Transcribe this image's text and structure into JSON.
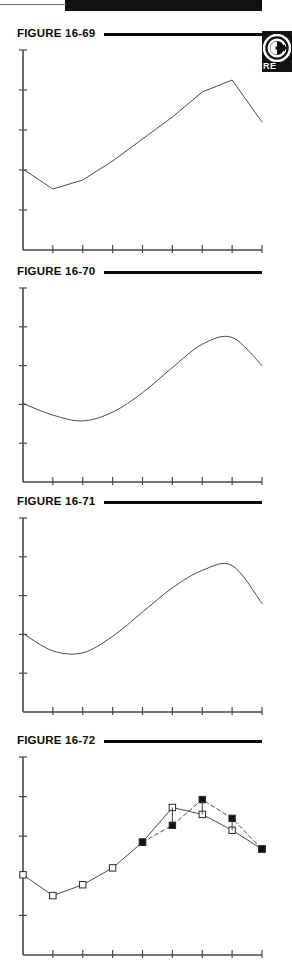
{
  "page": {
    "background_color": "#ffffff",
    "ink_color": "#0b0b0b",
    "line_color": "#555555",
    "width": 292,
    "height": 960
  },
  "top_bar": {
    "name": "page-edge-black-bar",
    "color": "#111111"
  },
  "badge": {
    "label": "RE",
    "icon": "circle-arrow-icon",
    "background": "#111111",
    "foreground": "#ffffff"
  },
  "figures": [
    {
      "label": "FIGURE 16-69",
      "top": 26,
      "plot_height": 224
    },
    {
      "label": "FIGURE 16-70",
      "top": 264,
      "plot_height": 218
    },
    {
      "label": "FIGURE 16-71",
      "top": 494,
      "plot_height": 218
    },
    {
      "label": "FIGURE 16-72",
      "top": 733,
      "plot_height": 222
    }
  ],
  "chart_data": [
    {
      "type": "line",
      "title": "FIGURE 16-69",
      "xlabel": "",
      "ylabel": "",
      "grid": false,
      "legend": "none",
      "axes": {
        "x_range": [
          0,
          8
        ],
        "y_range": [
          0,
          10
        ],
        "x_ticks": [
          1,
          2,
          3,
          4,
          5,
          6,
          7
        ],
        "y_ticks": [
          2,
          4,
          6,
          8
        ]
      },
      "series": [
        {
          "name": "series-1",
          "style": "solid",
          "marker": "none",
          "x": [
            0,
            1,
            2,
            3,
            4,
            5,
            6,
            7,
            8
          ],
          "y": [
            4.05,
            3.05,
            3.5,
            4.45,
            5.55,
            6.65,
            7.9,
            8.5,
            6.4
          ]
        }
      ]
    },
    {
      "type": "line",
      "title": "FIGURE 16-70",
      "xlabel": "",
      "ylabel": "",
      "grid": false,
      "legend": "none",
      "axes": {
        "x_range": [
          0,
          8
        ],
        "y_range": [
          0,
          10
        ],
        "x_ticks": [
          1,
          2,
          3,
          4,
          5,
          6,
          7
        ],
        "y_ticks": [
          2,
          4,
          6,
          8
        ]
      },
      "series": [
        {
          "name": "series-1",
          "style": "smooth",
          "marker": "none",
          "x": [
            0,
            1,
            2,
            3,
            4,
            5,
            6,
            7,
            8
          ],
          "y": [
            4.05,
            3.45,
            3.15,
            3.6,
            4.6,
            5.9,
            7.1,
            7.45,
            6.0
          ]
        }
      ]
    },
    {
      "type": "line",
      "title": "FIGURE 16-71",
      "xlabel": "",
      "ylabel": "",
      "grid": false,
      "legend": "none",
      "axes": {
        "x_range": [
          0,
          8
        ],
        "y_range": [
          0,
          10
        ],
        "x_ticks": [
          1,
          2,
          3,
          4,
          5,
          6,
          7
        ],
        "y_ticks": [
          2,
          4,
          6,
          8
        ]
      },
      "series": [
        {
          "name": "series-1",
          "style": "smooth",
          "marker": "none",
          "x": [
            0,
            1,
            2,
            3,
            4,
            5,
            6,
            7,
            8
          ],
          "y": [
            4.05,
            3.15,
            3.05,
            3.9,
            5.15,
            6.4,
            7.3,
            7.55,
            5.6
          ]
        }
      ]
    },
    {
      "type": "line",
      "title": "FIGURE 16-72",
      "xlabel": "",
      "ylabel": "",
      "grid": false,
      "legend": "none",
      "axes": {
        "x_range": [
          0,
          8
        ],
        "y_range": [
          0,
          10
        ],
        "x_ticks": [
          1,
          2,
          3,
          4,
          5,
          6,
          7
        ],
        "y_ticks": [
          2,
          4,
          6,
          8
        ]
      },
      "series": [
        {
          "name": "observed",
          "style": "solid",
          "marker": "open-square",
          "x": [
            0,
            1,
            2,
            3,
            4,
            5,
            6,
            7,
            8
          ],
          "y": [
            4.05,
            3.0,
            3.55,
            4.4,
            5.7,
            7.45,
            7.1,
            6.3,
            5.35
          ]
        },
        {
          "name": "forecast",
          "style": "dashed",
          "marker": "filled-square",
          "x": [
            4,
            5,
            6,
            7,
            8
          ],
          "y": [
            5.7,
            6.55,
            7.85,
            6.9,
            5.35
          ]
        }
      ]
    }
  ]
}
